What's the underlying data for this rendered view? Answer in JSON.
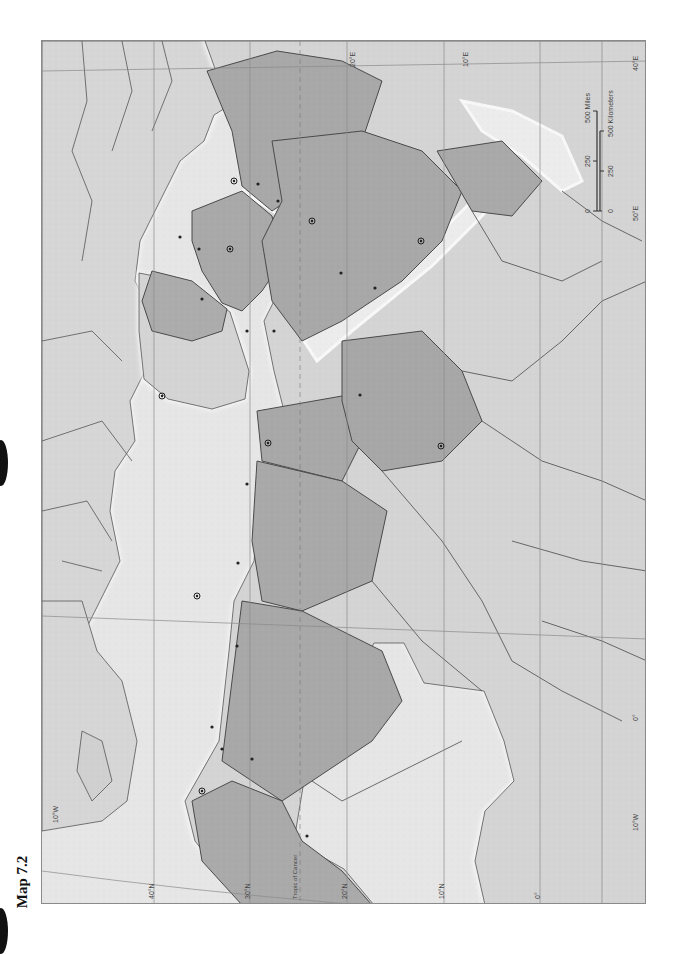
{
  "page": {
    "title": "Map 7.2",
    "binder_holes": 2
  },
  "map": {
    "orientation": "rotated 90° counterclockwise (north to the left)",
    "style": "blank grayscale relief outline map",
    "colors": {
      "ocean": "#e6e6e6",
      "land": "#d2d2d2",
      "highlighted_region": "#a9a9a9",
      "border": "#4a4a4a",
      "coast_glow": "#f7f7f7",
      "grid": "#8a8a8a"
    },
    "latitude_labels": [
      "40°N",
      "30°N",
      "20°N",
      "10°N",
      "0°"
    ],
    "longitude_labels_top": [
      "20°E",
      "10°E"
    ],
    "longitude_labels_right": [
      "10°W",
      "0°",
      "10°W"
    ],
    "right_edge_labels": [
      "40°E",
      "50°E"
    ],
    "tropic_label": "Tropic of Cancer",
    "scale_bar": {
      "miles": [
        "0",
        "250",
        "500 Miles"
      ],
      "kilometers": [
        "0",
        "250",
        "500 Kilometers"
      ]
    },
    "markers": {
      "capital_symbol": "circled-dot",
      "city_symbol": "dot"
    }
  }
}
